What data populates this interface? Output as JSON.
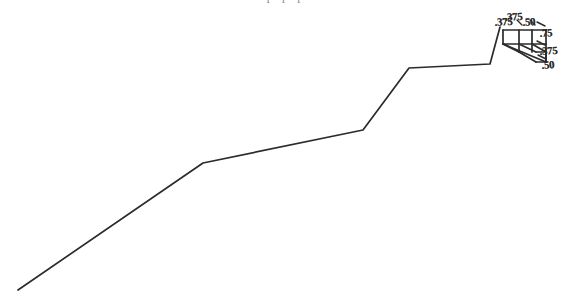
{
  "document": {
    "title": "Profile Line with Dimension Detail",
    "background_color": "#ffffff",
    "ink_color": "#2b2b2b",
    "width": 573,
    "height": 308
  },
  "top_cutoff": {
    "text": "p p p"
  },
  "profile": {
    "name": "profile-polyline",
    "stroke_color": "#2b2b2b",
    "stroke_width": 1.7,
    "points": "18,290 203,163 363,130 409,68 490,64 500,27"
  },
  "detail_box": {
    "name": "dimension-detail-box",
    "stroke_color": "#2b2b2b",
    "stroke_width": 1.7,
    "edges": [
      "503,30 546,30",
      "503,30 503,44",
      "503,44 546,44",
      "546,30 546,44",
      "519,30 519,52",
      "532,30 532,52",
      "503,44 546,62",
      "546,44 546,62",
      "519,44 536,52",
      "532,44 546,52",
      "503,44 519,52",
      "536,52 546,52",
      "546,52 546,62",
      "519,52 536,62",
      "536,62 546,62"
    ]
  },
  "dimension_labels": [
    {
      "name": "dim-label-top-left",
      "value": ".375",
      "x": 495,
      "y": 17
    },
    {
      "name": "dim-label-top-mid",
      "value": ".375",
      "x": 505,
      "y": 12
    },
    {
      "name": "dim-label-top-right",
      "value": ".50",
      "x": 523,
      "y": 17
    },
    {
      "name": "dim-label-right-upper",
      "value": ".75",
      "x": 540,
      "y": 28
    },
    {
      "name": "dim-label-right-mid",
      "value": ".375",
      "x": 540,
      "y": 46
    },
    {
      "name": "dim-label-right-lower",
      "value": ".50",
      "x": 542,
      "y": 60
    }
  ],
  "tick_marks": {
    "name": "dimension-tick-marks",
    "stroke_color": "#2b2b2b",
    "stroke_width": 1.4,
    "marks": [
      "537,22 545,26",
      "537,41 545,45",
      "538,55 546,59",
      "517,20 522,25",
      "530,20 535,25"
    ]
  }
}
